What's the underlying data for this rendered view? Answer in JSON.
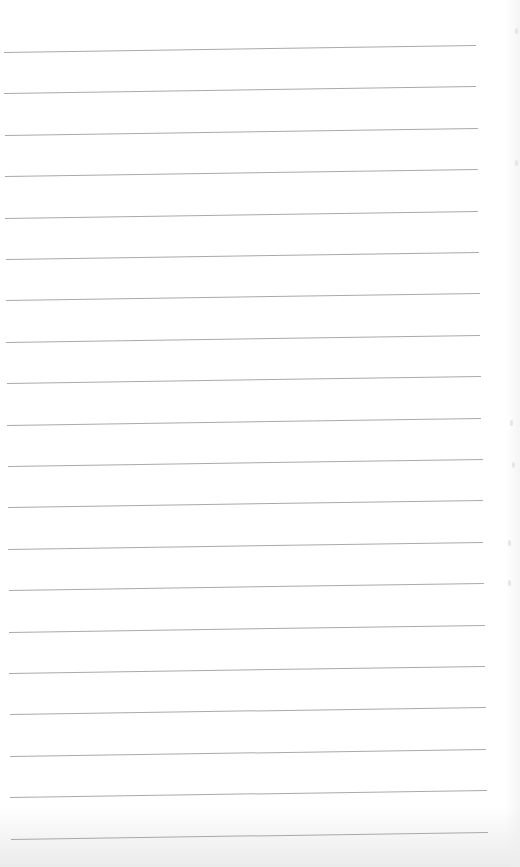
{
  "page": {
    "type": "lined-paper",
    "background_color": "#ffffff",
    "line_color": "#9a9a9a",
    "line_count": 20,
    "line_spacing_px": 41.4,
    "first_line_y": 52,
    "line_left_x": 4,
    "line_right_x": 476,
    "line_rise_px": 7,
    "content_text": ""
  }
}
